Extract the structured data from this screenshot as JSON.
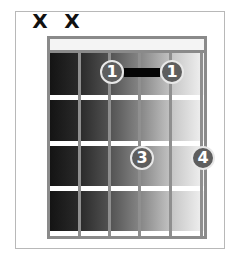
{
  "diagram": {
    "type": "guitar-chord-diagram",
    "strings": 6,
    "frets_shown": 4,
    "muted_strings": [
      {
        "string": 6,
        "symbol": "X"
      },
      {
        "string": 5,
        "symbol": "X"
      }
    ],
    "fingers": [
      {
        "label": "1",
        "string": 4,
        "fret": 1
      },
      {
        "label": "1",
        "string": 2,
        "fret": 1
      },
      {
        "label": "3",
        "string": 3,
        "fret": 3
      },
      {
        "label": "4",
        "string": 1,
        "fret": 3
      }
    ],
    "barre": {
      "from_string": 4,
      "to_string": 2,
      "fret": 1
    },
    "colors": {
      "frame_border": "#b8b8b8",
      "fretboard_dark": "#141414",
      "fretboard_light": "#f2f2f2",
      "string": "#8f8f8f",
      "fret": "#ffffff",
      "dot_fill": "#5e5e5e",
      "dot_ring": "#e8e8e8",
      "barre": "#050505"
    }
  }
}
